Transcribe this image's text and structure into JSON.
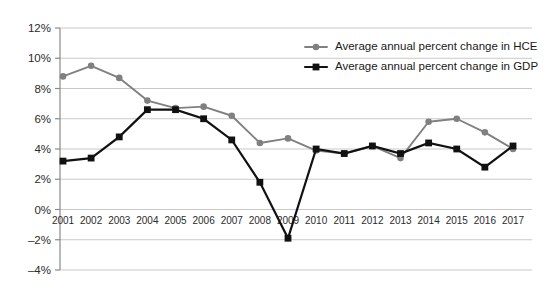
{
  "chart_data": {
    "type": "line",
    "title": "",
    "subtitle": "",
    "xlabel": "",
    "ylabel": "",
    "grid": true,
    "legend_position": "top-right",
    "ylim": [
      -4,
      12
    ],
    "ytick_step": 2,
    "ytick_labels": [
      "12%",
      "10%",
      "8%",
      "6%",
      "4%",
      "2%",
      "0%",
      "–2%",
      "–4%"
    ],
    "ytick_values": [
      12,
      10,
      8,
      6,
      4,
      2,
      0,
      -2,
      -4
    ],
    "categories": [
      "2001",
      "2002",
      "2003",
      "2004",
      "2005",
      "2006",
      "2007",
      "2008",
      "2009",
      "2010",
      "2011",
      "2012",
      "2013",
      "2014",
      "2015",
      "2016",
      "2017"
    ],
    "series": [
      {
        "name": "Average annual percent change in HCE",
        "color": "#808080",
        "marker": "circle",
        "values": [
          8.8,
          9.5,
          8.7,
          7.2,
          6.7,
          6.8,
          6.2,
          4.4,
          4.7,
          3.9,
          3.7,
          4.2,
          3.4,
          5.8,
          6.0,
          5.1,
          4.0
        ]
      },
      {
        "name": "Average annual percent change in GDP",
        "color": "#111111",
        "marker": "square",
        "values": [
          3.2,
          3.4,
          4.8,
          6.6,
          6.6,
          6.0,
          4.6,
          1.8,
          -1.9,
          4.0,
          3.7,
          4.2,
          3.7,
          4.4,
          4.0,
          2.8,
          4.2
        ]
      }
    ]
  },
  "legend": {
    "items": [
      {
        "label": "Average annual percent change in HCE",
        "color": "#808080",
        "marker": "circle"
      },
      {
        "label": "Average annual percent change in GDP",
        "color": "#111111",
        "marker": "square"
      }
    ]
  },
  "colors": {
    "hce": "#808080",
    "gdp": "#111111",
    "gridline": "#c9c9c9",
    "axis": "#8a8a8a",
    "background": "#ffffff",
    "text": "#2b2b2b"
  }
}
